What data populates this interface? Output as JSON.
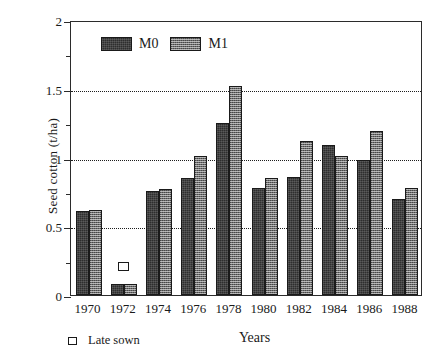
{
  "chart_data": {
    "type": "bar",
    "title": "",
    "xlabel": "Years",
    "ylabel": "Seed cotton (t/ha)",
    "categories": [
      "1970",
      "1972",
      "1974",
      "1976",
      "1978",
      "1980",
      "1982",
      "1984",
      "1986",
      "1988"
    ],
    "series": [
      {
        "name": "M0",
        "values": [
          0.61,
          0.08,
          0.76,
          0.85,
          1.25,
          0.78,
          0.86,
          1.09,
          0.98,
          0.7
        ]
      },
      {
        "name": "M1",
        "values": [
          0.62,
          0.08,
          0.77,
          1.01,
          1.52,
          0.85,
          1.12,
          1.01,
          1.19,
          0.78
        ]
      }
    ],
    "ylim": [
      0,
      2
    ],
    "ytick_labels": [
      "0",
      "0.5",
      "1",
      "1.5",
      "2"
    ],
    "ytick_values": [
      0,
      0.5,
      1,
      1.5,
      2
    ],
    "yminor_tick_values": [
      0.25,
      0.75,
      1.25,
      1.75
    ],
    "gridlines": [
      0.5,
      1,
      1.5
    ],
    "grid": true,
    "grid_style": "dotted",
    "legend_position": "top-left-inside",
    "annotations": [
      {
        "name": "late-sown-marker",
        "label": "Late sown",
        "category": "1972",
        "value": 0.22,
        "marker": "open-square"
      }
    ],
    "colors": {
      "m0": "#2e2e2e",
      "m1": "#6d6d6d",
      "axis": "#2b2b2b",
      "grid": "#1d1d1d",
      "background": "#ffffff"
    }
  },
  "legend": {
    "items": [
      {
        "label": "M0",
        "key": "m0"
      },
      {
        "label": "M1",
        "key": "m1"
      }
    ]
  },
  "late_sown_key": {
    "label": "Late sown"
  }
}
